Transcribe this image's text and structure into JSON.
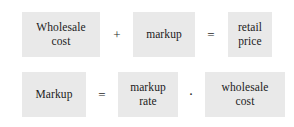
{
  "diagram": {
    "background_color": "#ffffff",
    "box_color": "#e9e9e9",
    "text_color": "#1b1b1b",
    "equations": [
      {
        "id": "retail-price-equation",
        "terms": [
          {
            "id": "wholesale-cost",
            "lines": [
              "Wholesale",
              "cost"
            ]
          },
          {
            "id": "markup",
            "lines": [
              "markup"
            ]
          },
          {
            "id": "retail-price",
            "lines": [
              "retail",
              "price"
            ]
          }
        ],
        "operators": [
          {
            "id": "plus",
            "symbol": "+",
            "name": "plus-operator"
          },
          {
            "id": "equals",
            "symbol": "=",
            "name": "equals-operator"
          }
        ]
      },
      {
        "id": "markup-equation",
        "terms": [
          {
            "id": "markup",
            "lines": [
              "Markup"
            ]
          },
          {
            "id": "markup-rate",
            "lines": [
              "markup",
              "rate"
            ]
          },
          {
            "id": "wholesale-cost",
            "lines": [
              "wholesale",
              "cost"
            ]
          }
        ],
        "operators": [
          {
            "id": "equals",
            "symbol": "=",
            "name": "equals-operator"
          },
          {
            "id": "dot",
            "symbol": "·",
            "name": "multiplication-dot-operator"
          }
        ]
      }
    ]
  }
}
